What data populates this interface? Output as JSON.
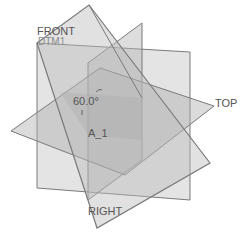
{
  "viewport": {
    "background": "#ffffff",
    "plane_fill": "#b8b8b8",
    "plane_edge": "#7a7a7a",
    "label_color": "#555555"
  },
  "datum_planes": [
    {
      "id": "front",
      "label": "FRONT"
    },
    {
      "id": "top",
      "label": "TOP"
    },
    {
      "id": "right",
      "label": "RIGHT"
    },
    {
      "id": "dtm1",
      "label": "DTM1"
    }
  ],
  "datum_axis": {
    "label": "A_1"
  },
  "dimension": {
    "value": "60.0°"
  },
  "labels": {
    "front": "FRONT",
    "dtm1": "DTM1",
    "top": "TOP",
    "right": "RIGHT",
    "axis": "A_1",
    "angle": "60.0°"
  }
}
